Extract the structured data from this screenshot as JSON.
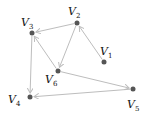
{
  "graph": {
    "nodes": [
      {
        "id": "V1",
        "letter": "V",
        "sub": "1",
        "x": 104,
        "y": 62,
        "lx": 100,
        "ly": 55
      },
      {
        "id": "V2",
        "letter": "V",
        "sub": "2",
        "x": 77,
        "y": 23,
        "lx": 68,
        "ly": 15
      },
      {
        "id": "V3",
        "letter": "V",
        "sub": "3",
        "x": 32,
        "y": 33,
        "lx": 21,
        "ly": 26
      },
      {
        "id": "V4",
        "letter": "V",
        "sub": "4",
        "x": 30,
        "y": 97,
        "lx": 8,
        "ly": 103
      },
      {
        "id": "V5",
        "letter": "V",
        "sub": "5",
        "x": 133,
        "y": 89,
        "lx": 127,
        "ly": 108
      },
      {
        "id": "V6",
        "letter": "V",
        "sub": "6",
        "x": 58,
        "y": 71,
        "lx": 45,
        "ly": 83
      }
    ],
    "edges": [
      {
        "from": "V1",
        "to": "V2"
      },
      {
        "from": "V2",
        "to": "V3"
      },
      {
        "from": "V2",
        "to": "V6"
      },
      {
        "from": "V6",
        "to": "V3"
      },
      {
        "from": "V3",
        "to": "V4"
      },
      {
        "from": "V6",
        "to": "V5"
      },
      {
        "from": "V5",
        "to": "V4"
      }
    ],
    "edge_color": "#bdbdbd",
    "node_color": "#555555"
  }
}
